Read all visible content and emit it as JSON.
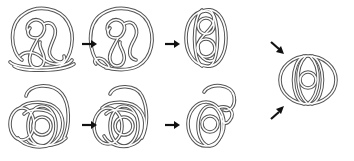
{
  "figure": {
    "colors": {
      "tube_stroke": "#555555",
      "tube_fill": "#ffffff",
      "arrow": "#111111",
      "background": "#ffffff"
    },
    "rows": [
      {
        "name": "top-row",
        "knots": [
          "knot-1a",
          "knot-1b",
          "knot-1c"
        ]
      },
      {
        "name": "bottom-row",
        "knots": [
          "knot-2a",
          "knot-2b",
          "knot-2c"
        ]
      }
    ],
    "final": "knot-final",
    "arrows": [
      {
        "from": "knot-1a",
        "to": "knot-1b",
        "direction": "right"
      },
      {
        "from": "knot-1b",
        "to": "knot-1c",
        "direction": "right"
      },
      {
        "from": "knot-2a",
        "to": "knot-2b",
        "direction": "right"
      },
      {
        "from": "knot-2b",
        "to": "knot-2c",
        "direction": "right"
      },
      {
        "from": "knot-1c",
        "to": "knot-final",
        "direction": "down-right"
      },
      {
        "from": "knot-2c",
        "to": "knot-final",
        "direction": "up-right"
      }
    ]
  }
}
